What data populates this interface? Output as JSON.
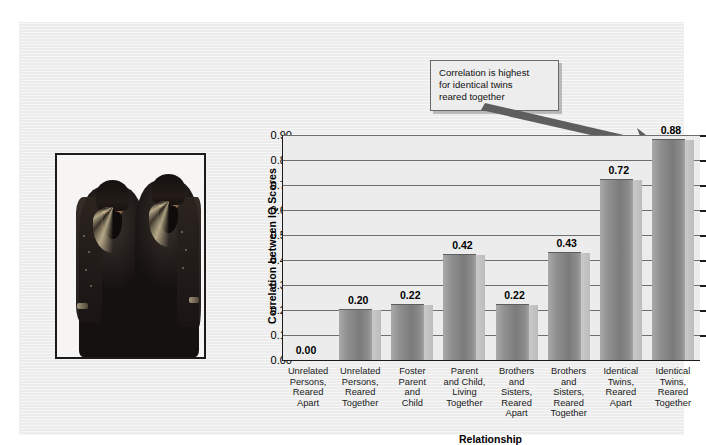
{
  "figure": {
    "annotation": {
      "text": "Correlation is highest for identical twins reared together",
      "lines": [
        "Correlation is highest",
        "for identical twins",
        "reared together"
      ],
      "arrow_name": "annotation-arrow"
    },
    "photo": {
      "alt": "Photograph of identical twin girls in dark embroidered dresses",
      "subject": "identical-twins"
    }
  },
  "chart_data": {
    "type": "bar",
    "title": "",
    "xlabel": "Relationship",
    "ylabel": "Correlation between IQ Scores",
    "ylim": [
      0.0,
      0.9
    ],
    "grid": true,
    "legend": false,
    "categories": [
      "Unrelated Persons, Reared Apart",
      "Unrelated Persons, Reared Together",
      "Foster Parent and Child",
      "Parent and Child, Living Together",
      "Brothers and Sisters, Reared Apart",
      "Brothers and Sisters, Reared Together",
      "Identical Twins, Reared Apart",
      "Identical Twins, Reared Together"
    ],
    "category_lines": [
      [
        "Unrelated",
        "Persons,",
        "Reared",
        "Apart"
      ],
      [
        "Unrelated",
        "Persons,",
        "Reared",
        "Together"
      ],
      [
        "Foster",
        "Parent",
        "and",
        "Child"
      ],
      [
        "Parent",
        "and Child,",
        "Living",
        "Together"
      ],
      [
        "Brothers",
        "and",
        "Sisters,",
        "Reared",
        "Apart"
      ],
      [
        "Brothers",
        "and",
        "Sisters,",
        "Reared",
        "Together"
      ],
      [
        "Identical",
        "Twins,",
        "Reared",
        "Apart"
      ],
      [
        "Identical",
        "Twins,",
        "Reared",
        "Together"
      ]
    ],
    "values": [
      0.0,
      0.2,
      0.22,
      0.42,
      0.22,
      0.43,
      0.72,
      0.88
    ],
    "value_labels": [
      "0.00",
      "0.20",
      "0.22",
      "0.42",
      "0.22",
      "0.43",
      "0.72",
      "0.88"
    ],
    "ytick_labels": [
      "0.90",
      "0.80",
      "0.70",
      "0.60",
      "0.50",
      "0.40",
      "0.30",
      "0.20",
      "0.10",
      "0.00"
    ],
    "ytick_values": [
      0.9,
      0.8,
      0.7,
      0.6,
      0.5,
      0.4,
      0.3,
      0.2,
      0.1,
      0.0
    ],
    "colors": {
      "bar_fill": "#8e8e8e",
      "bar_side": "#c2c2c2",
      "plot_background": "#ececec",
      "panel_background": "#efefef",
      "gridline": "#6e6e6e",
      "axis": "#1c1c1c",
      "text": "#000000",
      "arrow": "#5a5a5a"
    }
  }
}
